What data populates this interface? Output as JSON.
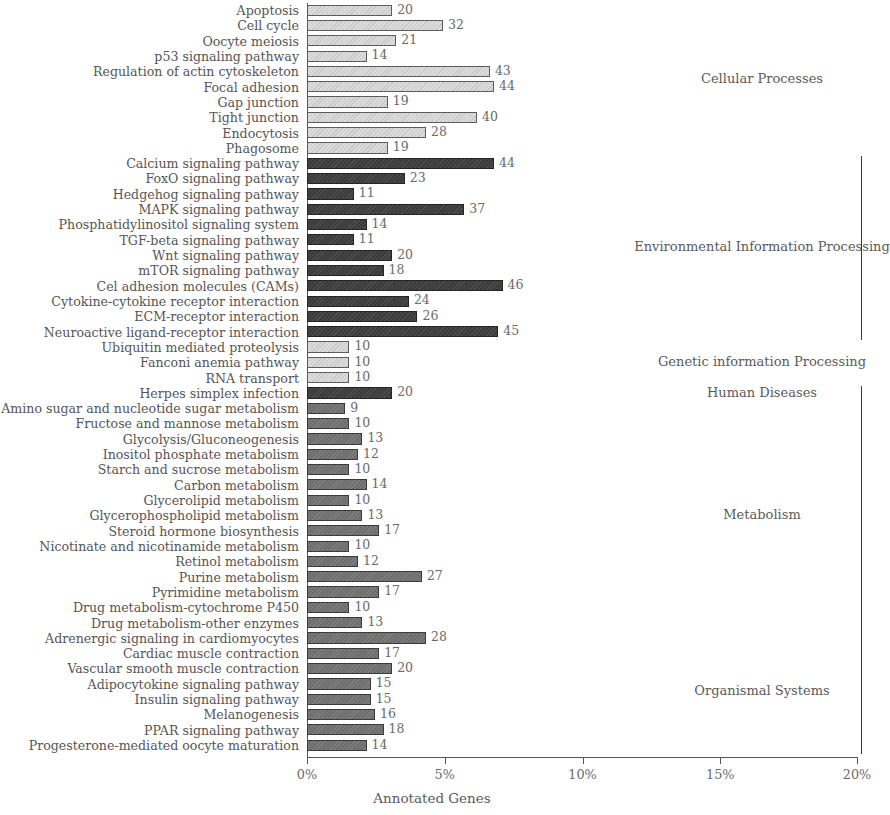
{
  "chart_data": {
    "type": "bar",
    "title": "",
    "xlabel": "Annotated Genes",
    "ylabel": "",
    "orientation": "horizontal",
    "xlim": [
      0,
      20
    ],
    "xunit": "%",
    "xticks": [
      "0%",
      "5%",
      "10%",
      "15%",
      "20%"
    ],
    "xtick_values": [
      0,
      5,
      10,
      15,
      20
    ],
    "grid": false,
    "legend": "none",
    "total_genes_basis": 648,
    "group_order": [
      "Cellular Processes",
      "Environmental Information Processing",
      "Genetic information Processing",
      "Human Diseases",
      "Metabolism",
      "Organismal Systems"
    ],
    "group_colors": {
      "Cellular Processes": "#dcdcdc",
      "Environmental Information Processing": "#3b3b3b",
      "Genetic information Processing": "#dcdcdc",
      "Human Diseases": "#3b3b3b",
      "Metabolism": "#6e6e6e",
      "Organismal Systems": "#6e6e6e"
    },
    "categories": [
      "Apoptosis",
      "Cell cycle",
      "Oocyte meiosis",
      "p53 signaling pathway",
      "Regulation of actin cytoskeleton",
      "Focal adhesion",
      "Gap junction",
      "Tight junction",
      "Endocytosis",
      "Phagosome",
      "Calcium signaling pathway",
      "FoxO signaling pathway",
      "Hedgehog signaling pathway",
      "MAPK signaling pathway",
      "Phosphatidylinositol signaling system",
      "TGF-beta signaling pathway",
      "Wnt signaling pathway",
      "mTOR signaling pathway",
      "Cel adhesion molecules (CAMs)",
      "Cytokine-cytokine receptor interaction",
      "ECM-receptor interaction",
      "Neuroactive ligand-receptor interaction",
      "Ubiquitin mediated proteolysis",
      "Fanconi anemia pathway",
      "RNA transport",
      "Herpes simplex infection",
      "Amino sugar and nucleotide sugar metabolism",
      "Fructose and mannose metabolism",
      "Glycolysis/Gluconeogenesis",
      "Inositol phosphate metabolism",
      "Starch and sucrose metabolism",
      "Carbon metabolism",
      "Glycerolipid metabolism",
      "Glycerophospholipid metabolism",
      "Steroid hormone biosynthesis",
      "Nicotinate and nicotinamide metabolism",
      "Retinol metabolism",
      "Purine metabolism",
      "Pyrimidine metabolism",
      "Drug metabolism-cytochrome P450",
      "Drug metabolism-other enzymes",
      "Adrenergic signaling in cardiomyocytes",
      "Cardiac muscle contraction",
      "Vascular smooth muscle contraction",
      "Adipocytokine signaling pathway",
      "Insulin signaling pathway",
      "Melanogenesis",
      "PPAR signaling pathway",
      "Progesterone-mediated oocyte maturation"
    ],
    "values": [
      20,
      32,
      21,
      14,
      43,
      44,
      19,
      40,
      28,
      19,
      44,
      23,
      11,
      37,
      14,
      11,
      20,
      18,
      46,
      24,
      26,
      45,
      10,
      10,
      10,
      20,
      9,
      10,
      13,
      12,
      10,
      14,
      10,
      13,
      17,
      10,
      12,
      27,
      17,
      10,
      13,
      28,
      17,
      20,
      15,
      15,
      16,
      18,
      14
    ],
    "percents": [
      3.09,
      4.94,
      3.24,
      2.16,
      6.64,
      6.79,
      2.93,
      6.17,
      4.32,
      2.93,
      6.79,
      3.55,
      1.7,
      5.71,
      2.16,
      1.7,
      3.09,
      2.78,
      7.1,
      3.7,
      4.01,
      6.94,
      1.54,
      1.54,
      1.54,
      3.09,
      1.39,
      1.54,
      2.01,
      1.85,
      1.54,
      2.16,
      1.54,
      2.01,
      2.62,
      1.54,
      1.85,
      4.17,
      2.62,
      1.54,
      2.01,
      4.32,
      2.62,
      3.09,
      2.31,
      2.31,
      2.47,
      2.78,
      2.16
    ],
    "group_of": [
      "Cellular Processes",
      "Cellular Processes",
      "Cellular Processes",
      "Cellular Processes",
      "Cellular Processes",
      "Cellular Processes",
      "Cellular Processes",
      "Cellular Processes",
      "Cellular Processes",
      "Cellular Processes",
      "Environmental Information Processing",
      "Environmental Information Processing",
      "Environmental Information Processing",
      "Environmental Information Processing",
      "Environmental Information Processing",
      "Environmental Information Processing",
      "Environmental Information Processing",
      "Environmental Information Processing",
      "Environmental Information Processing",
      "Environmental Information Processing",
      "Environmental Information Processing",
      "Environmental Information Processing",
      "Genetic information Processing",
      "Genetic information Processing",
      "Genetic information Processing",
      "Human Diseases",
      "Metabolism",
      "Metabolism",
      "Metabolism",
      "Metabolism",
      "Metabolism",
      "Metabolism",
      "Metabolism",
      "Metabolism",
      "Metabolism",
      "Metabolism",
      "Metabolism",
      "Metabolism",
      "Metabolism",
      "Metabolism",
      "Metabolism",
      "Organismal Systems",
      "Organismal Systems",
      "Organismal Systems",
      "Organismal Systems",
      "Organismal Systems",
      "Organismal Systems",
      "Organismal Systems",
      "Organismal Systems"
    ],
    "group_annotations": [
      {
        "label": "Cellular Processes",
        "first_index": 0,
        "last_index": 9,
        "bracket": false
      },
      {
        "label": "Environmental Information Processing",
        "first_index": 10,
        "last_index": 21,
        "bracket": true
      },
      {
        "label": "Genetic information Processing",
        "first_index": 22,
        "last_index": 24,
        "bracket": false
      },
      {
        "label": "Human Diseases",
        "first_index": 25,
        "last_index": 25,
        "bracket": true
      },
      {
        "label": "Metabolism",
        "first_index": 26,
        "last_index": 40,
        "bracket": true
      },
      {
        "label": "Organismal Systems",
        "first_index": 41,
        "last_index": 48,
        "bracket": true
      }
    ]
  }
}
